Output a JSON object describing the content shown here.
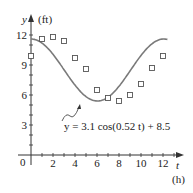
{
  "chart_data": {
    "type": "scatter",
    "title": "",
    "xlabel": "t",
    "xunit": "(h)",
    "ylabel": "y",
    "yunit": "(ft)",
    "xlim": [
      0,
      13
    ],
    "ylim": [
      0,
      12.5
    ],
    "x_ticks": [
      2,
      4,
      6,
      8,
      10,
      12
    ],
    "y_ticks": [
      3,
      6,
      9,
      12
    ],
    "origin_label": "0",
    "grid": false,
    "series": [
      {
        "name": "data",
        "type": "scatter",
        "marker": "open-square",
        "x": [
          0,
          1,
          2,
          3,
          4,
          5,
          6,
          7,
          8,
          9,
          10,
          11,
          12
        ],
        "y": [
          9.9,
          11.6,
          11.8,
          11.4,
          9.7,
          8.6,
          6.5,
          5.7,
          5.4,
          6.0,
          7.1,
          8.7,
          9.9
        ]
      },
      {
        "name": "model",
        "type": "line",
        "equation": "y = 3.1 cos(0.52 t) + 8.5",
        "amplitude": 3.1,
        "frequency": 0.52,
        "offset": 8.5
      }
    ],
    "annotations": [
      {
        "text": "y = 3.1 cos(0.52 t) + 8.5",
        "points_to": "curve near t=5"
      }
    ]
  },
  "labels": {
    "y_axis": "y",
    "y_unit": "(ft)",
    "x_axis": "t",
    "x_unit": "(h)",
    "origin": "0",
    "equation": "y = 3.1 cos(0.52 t) + 8.5"
  },
  "colors": {
    "curve": "#7a7a7a",
    "axis": "#333333",
    "marker": "#555555"
  }
}
